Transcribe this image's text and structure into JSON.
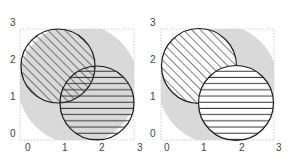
{
  "figure": {
    "colors": {
      "background_region": "#d9d9d9",
      "outline": "#1a1a1a",
      "frame_dots": "#cccccc",
      "tick_text": "#444444",
      "circle_fill_right_panel": "#ffffff"
    },
    "panels": [
      {
        "id": "left",
        "overlap_style": "transparent fills, both hatches visible in overlap",
        "x_ticks": [
          "0",
          "1",
          "2",
          "3"
        ],
        "y_ticks": [
          "0",
          "1",
          "2",
          "3"
        ],
        "circles": [
          {
            "name": "diagonal-hatched",
            "cx": 0.8,
            "cy": 1.8,
            "r": 1.0,
            "hatch": "diagonal"
          },
          {
            "name": "horizontal-striped",
            "cx": 1.85,
            "cy": 0.8,
            "r": 1.0,
            "hatch": "horizontal"
          }
        ]
      },
      {
        "id": "right",
        "overlap_style": "opaque white fills, striped circle drawn on top",
        "x_ticks": [
          "0",
          "1",
          "2",
          "3"
        ],
        "y_ticks": [
          "0",
          "1",
          "2",
          "3"
        ],
        "circles": [
          {
            "name": "diagonal-hatched",
            "cx": 0.8,
            "cy": 1.8,
            "r": 1.0,
            "hatch": "diagonal"
          },
          {
            "name": "horizontal-striped",
            "cx": 1.85,
            "cy": 0.8,
            "r": 1.0,
            "hatch": "horizontal"
          }
        ]
      }
    ]
  },
  "left": {
    "x_ticks": [
      "0",
      "1",
      "2",
      "3"
    ],
    "y_ticks": [
      "0",
      "1",
      "2",
      "3"
    ]
  },
  "right": {
    "x_ticks": [
      "0",
      "1",
      "2",
      "3"
    ],
    "y_ticks": [
      "0",
      "1",
      "2",
      "3"
    ]
  }
}
